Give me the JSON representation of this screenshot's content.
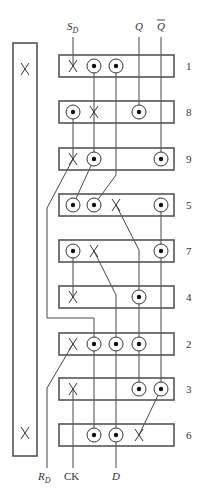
{
  "diagram": {
    "title": "",
    "tall_block": {
      "x": 13,
      "y": 43,
      "w": 24,
      "h": 413,
      "marks": [
        {
          "x": 25,
          "y": 69
        },
        {
          "x": 25,
          "y": 433
        }
      ]
    },
    "columns": {
      "A": 73,
      "B": 94,
      "C": 116,
      "D": 139,
      "E": 161
    },
    "boxes": [
      {
        "id": "1",
        "label": "1",
        "y": 55,
        "h": 22,
        "pins": [
          {
            "col": "A",
            "type": "cross"
          },
          {
            "col": "B",
            "type": "dot"
          },
          {
            "col": "C",
            "type": "dot"
          }
        ]
      },
      {
        "id": "8",
        "label": "8",
        "y": 101,
        "h": 22,
        "pins": [
          {
            "col": "A",
            "type": "dot"
          },
          {
            "col": "B",
            "type": "cross"
          },
          {
            "col": "D",
            "type": "dot"
          }
        ]
      },
      {
        "id": "9",
        "label": "9",
        "y": 148,
        "h": 22,
        "pins": [
          {
            "col": "A",
            "type": "cross"
          },
          {
            "col": "B",
            "type": "dot"
          },
          {
            "col": "E",
            "type": "dot"
          }
        ]
      },
      {
        "id": "5",
        "label": "5",
        "y": 194,
        "h": 22,
        "pins": [
          {
            "col": "A",
            "type": "dot"
          },
          {
            "col": "B",
            "type": "dot"
          },
          {
            "col": "C",
            "type": "cross"
          },
          {
            "col": "E",
            "type": "dot"
          }
        ]
      },
      {
        "id": "7",
        "label": "7",
        "y": 240,
        "h": 22,
        "pins": [
          {
            "col": "A",
            "type": "dot"
          },
          {
            "col": "B",
            "type": "cross"
          },
          {
            "col": "E",
            "type": "dot"
          }
        ]
      },
      {
        "id": "4",
        "label": "4",
        "y": 286,
        "h": 22,
        "pins": [
          {
            "col": "A",
            "type": "cross"
          },
          {
            "col": "D",
            "type": "dot"
          }
        ]
      },
      {
        "id": "2",
        "label": "2",
        "y": 333,
        "h": 22,
        "pins": [
          {
            "col": "A",
            "type": "cross"
          },
          {
            "col": "B",
            "type": "dot"
          },
          {
            "col": "C",
            "type": "dot"
          },
          {
            "col": "D",
            "type": "dot"
          }
        ]
      },
      {
        "id": "3",
        "label": "3",
        "y": 378,
        "h": 22,
        "pins": [
          {
            "col": "A",
            "type": "cross"
          },
          {
            "col": "D",
            "type": "dot"
          },
          {
            "col": "E",
            "type": "dot"
          }
        ]
      },
      {
        "id": "6",
        "label": "6",
        "y": 424,
        "h": 22,
        "pins": [
          {
            "col": "B",
            "type": "dot"
          },
          {
            "col": "C",
            "type": "dot"
          },
          {
            "col": "D",
            "type": "cross"
          }
        ]
      }
    ],
    "box_x": 59,
    "box_w": 115,
    "label_x": 186,
    "wires": [
      "73,37 73,66",
      "139,37 139,112",
      "161,37 161,159",
      "94,66 94,112",
      "116,66 116,175 94,205",
      "73,112 73,159",
      "94,112 94,159",
      "73,159 47,208 47,318 94,318 94,344",
      "94,159 73,205",
      "116,205 139,250 139,297",
      "161,205 161,251",
      "73,251 73,297",
      "94,251 116,295 116,344",
      "161,251 161,389",
      "139,297 139,389",
      "94,344 94,435",
      "116,344 116,435",
      "73,344 47,388 47,468",
      "73,389 73,468",
      "161,389 139,435",
      "116,435 116,468"
    ],
    "inputs": {
      "top": [
        {
          "text": "S",
          "sub": "D",
          "x": 67,
          "y": 30,
          "italic": true
        },
        {
          "text": "Q",
          "sub": "",
          "x": 135,
          "y": 30,
          "italic": true
        },
        {
          "text": "Q",
          "sub": "",
          "x": 157,
          "y": 30,
          "italic": true,
          "overline": true
        }
      ],
      "bottom": [
        {
          "text": "R",
          "sub": "D",
          "x": 38,
          "y": 480,
          "italic": true
        },
        {
          "text": "CK",
          "sub": "",
          "x": 64,
          "y": 480,
          "italic": false
        },
        {
          "text": "D",
          "sub": "",
          "x": 112,
          "y": 480,
          "italic": true
        }
      ]
    },
    "colors": {
      "box_stroke": "#555555",
      "wire": "#333333",
      "dot": "#111111"
    }
  }
}
